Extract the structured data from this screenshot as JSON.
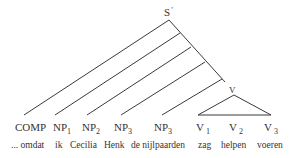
{
  "root": {
    "label": "S",
    "prime": "′"
  },
  "v_node": {
    "label": "V"
  },
  "categories": [
    {
      "base": "COMP",
      "sub": ""
    },
    {
      "base": "NP",
      "sub": "1"
    },
    {
      "base": "NP",
      "sub": "2"
    },
    {
      "base": "NP",
      "sub": "3"
    },
    {
      "base": "NP",
      "sub": "3"
    },
    {
      "base": "V",
      "sub": "1"
    },
    {
      "base": "V",
      "sub": "2"
    },
    {
      "base": "V",
      "sub": "3"
    }
  ],
  "words": [
    "... omdat",
    "ik",
    "Cecilia",
    "Henk",
    "de nijlpaarden",
    "zag",
    "helpen",
    "voeren"
  ]
}
